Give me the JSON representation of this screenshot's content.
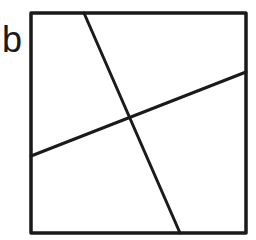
{
  "figure": {
    "panel_label": "b",
    "stroke_color": "#1a1a1a",
    "background": "#ffffff",
    "box": {
      "x1": 31,
      "y1": 13,
      "x2": 246,
      "y2": 233
    },
    "lines": [
      {
        "name": "steep-line",
        "x1": 84,
        "y1": 13,
        "x2": 180,
        "y2": 233
      },
      {
        "name": "shallow-line",
        "x1": 31,
        "y1": 156,
        "x2": 246,
        "y2": 72
      }
    ],
    "intersection": {
      "x": 129,
      "y": 118
    }
  }
}
